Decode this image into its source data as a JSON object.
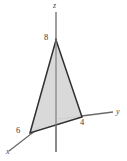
{
  "figure": {
    "kind": "3d-axes-plane-intercept-diagram",
    "background_color": "#ffffff",
    "width": 127,
    "height": 161
  },
  "axes": {
    "z": {
      "label": "z",
      "icon": "axis-line-vertical",
      "color": "#6a6a6a",
      "start": [
        56,
        12
      ],
      "end": [
        56,
        152
      ]
    },
    "y": {
      "label": "y",
      "icon": "axis-line-horizontal",
      "color": "#6a6a6a",
      "start": [
        82,
        117
      ],
      "end": [
        113,
        112
      ]
    },
    "x": {
      "label": "x",
      "icon": "axis-line-diagonal",
      "color": "#6a6a6a",
      "start": [
        30,
        133
      ],
      "end": [
        9,
        151
      ]
    }
  },
  "plane": {
    "name": "shaded-triangle",
    "fill_color": "#d7d7d7",
    "edge_color": "#303030",
    "edge_width": 1.5,
    "vertices": [
      [
        56,
        40
      ],
      [
        82,
        117
      ],
      [
        30,
        133
      ]
    ]
  },
  "intercepts": [
    {
      "axis": "z",
      "value": "8",
      "label_position": [
        44,
        33
      ],
      "point": [
        56,
        40
      ]
    },
    {
      "axis": "y",
      "value": "4",
      "label_position": [
        80,
        118
      ],
      "point": [
        82,
        117
      ]
    },
    {
      "axis": "x",
      "value": "6",
      "label_position": [
        16,
        126
      ],
      "point": [
        30,
        133
      ]
    }
  ]
}
